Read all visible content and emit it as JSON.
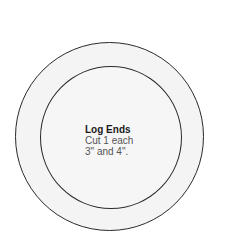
{
  "diagram": {
    "shape": "concentric-circles",
    "label": {
      "title": "Log Ends",
      "line1": "Cut 1 each",
      "line2": "3\" and 4\"."
    },
    "colors": {
      "stroke": "#2a2a2a",
      "fill": "#f4f4f4",
      "title_text": "#1a1a1a",
      "body_text": "#555555"
    }
  }
}
